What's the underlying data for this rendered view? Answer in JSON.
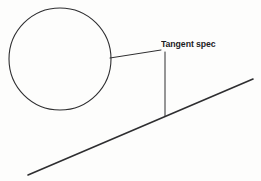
{
  "canvas": {
    "width": 261,
    "height": 181,
    "background_color": "#fdfdfc",
    "stroke_color": "#2e2e30",
    "text_color": "#1d1d1f"
  },
  "annotation": {
    "label": "Tangent spec",
    "label_x": 161,
    "label_y": 39,
    "font_size": 9.5
  },
  "shapes": {
    "circle": {
      "name": "circle",
      "center_x": 60,
      "center_y": 59,
      "radius": 51,
      "stroke_width": 1.1
    },
    "incline": {
      "name": "inclined-line",
      "x1": 28,
      "y1": 175,
      "x2": 253,
      "y2": 79,
      "stroke_width": 1.6
    },
    "leader_line": {
      "name": "leader-line",
      "x1": 110,
      "y1": 58,
      "x2": 161,
      "y2": 50,
      "stroke_width": 1.0
    },
    "dimension_line": {
      "name": "vertical-dimension-line",
      "x1": 165,
      "y1": 52,
      "x2": 165,
      "y2": 116,
      "stroke_width": 1.0
    }
  }
}
